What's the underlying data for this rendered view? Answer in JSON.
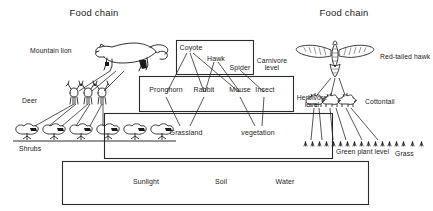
{
  "titles": {
    "left": "Food chain",
    "right": "Food chain"
  },
  "organisms": {
    "mountain_lion": "Mountain lion",
    "deer": "Deer",
    "shrubs": "Shrubs",
    "red_tailed_hawk": "Red-tailed hawk",
    "cottontail": "Cottontail",
    "grass": "Grass"
  },
  "carnivore_level": {
    "level_label_line1": "Carnivore",
    "level_label_line2": "level",
    "members": [
      "Coyote",
      "Hawk",
      "Spider"
    ]
  },
  "herbivore_level": {
    "level_label_line1": "Herbivore",
    "level_label_line2": "level",
    "members": [
      "Pronghorn",
      "Rabbit",
      "Mouse",
      "Insect"
    ]
  },
  "green_plant_level": {
    "level_label": "Green plant level",
    "members": [
      "Grassland",
      "vegetation"
    ]
  },
  "abiotic_level": {
    "members": [
      "Sunlight",
      "Soil",
      "Water"
    ]
  },
  "colors": {
    "ink": "#1a1a1a",
    "line": "#2b2b2b",
    "background": "#ffffff"
  },
  "counts": {
    "deer": 3,
    "shrubs": 6,
    "cottontails": 3,
    "grass_tufts": 17
  },
  "icons": {
    "mountain_lion": "mountain-lion-icon",
    "hawk": "hawk-icon",
    "deer": "deer-icon",
    "shrub": "shrub-icon",
    "cottontail": "cottontail-icon",
    "grass": "grass-tuft-icon"
  }
}
